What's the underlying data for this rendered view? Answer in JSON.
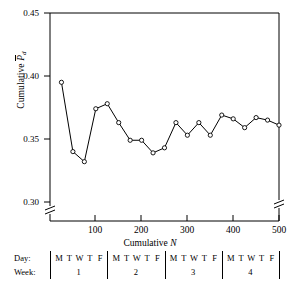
{
  "figure": {
    "type": "line-chart",
    "y_axis_label_prefix": "Cumulative ",
    "y_axis_label_symbol": "P",
    "y_axis_label_subscript": "d",
    "x_axis_label_prefix": "Cumulative ",
    "x_axis_label_symbol": "N",
    "axis_break": true,
    "line_color": "#000000",
    "marker_fill": "#ffffff",
    "marker_edge": "#000000"
  },
  "bottom_table": {
    "row_labels": [
      "Day:",
      "Week:"
    ],
    "days": [
      "M",
      "T",
      "W",
      "T",
      "F"
    ],
    "weeks": [
      "1",
      "2",
      "3",
      "4"
    ]
  },
  "chart_data": {
    "type": "line",
    "title": "",
    "xlabel": "Cumulative N",
    "ylabel": "Cumulative P̄d",
    "xlim": [
      0,
      500
    ],
    "ylim": [
      0.3,
      0.45
    ],
    "xticks": [
      100,
      200,
      300,
      400,
      500
    ],
    "xtick_labels": [
      "100",
      "200",
      "300",
      "400",
      "500"
    ],
    "yticks": [
      0.3,
      0.35,
      0.4,
      0.45
    ],
    "ytick_labels": [
      "0.30",
      "0.35",
      "0.40",
      "0.45"
    ],
    "grid": false,
    "legend": "none",
    "axis_break_y_below": 0.3,
    "x": [
      25,
      50,
      75,
      100,
      125,
      150,
      175,
      200,
      225,
      250,
      275,
      300,
      325,
      350,
      375,
      400,
      425,
      450,
      475,
      500
    ],
    "y": [
      0.395,
      0.34,
      0.332,
      0.374,
      0.378,
      0.363,
      0.349,
      0.349,
      0.339,
      0.343,
      0.363,
      0.353,
      0.363,
      0.353,
      0.369,
      0.366,
      0.359,
      0.367,
      0.365,
      0.361
    ],
    "series": [
      {
        "name": "Cumulative P-bar d",
        "values": [
          0.395,
          0.34,
          0.332,
          0.374,
          0.378,
          0.363,
          0.349,
          0.349,
          0.339,
          0.343,
          0.363,
          0.353,
          0.363,
          0.353,
          0.369,
          0.366,
          0.359,
          0.367,
          0.365,
          0.361
        ]
      }
    ],
    "point_day_labels": [
      "M",
      "T",
      "W",
      "T",
      "F",
      "M",
      "T",
      "W",
      "T",
      "F",
      "M",
      "T",
      "W",
      "T",
      "F",
      "M",
      "T",
      "W",
      "T",
      "F"
    ],
    "point_week_labels": [
      "1",
      "1",
      "1",
      "1",
      "1",
      "2",
      "2",
      "2",
      "2",
      "2",
      "3",
      "3",
      "3",
      "3",
      "3",
      "4",
      "4",
      "4",
      "4",
      "4"
    ]
  }
}
